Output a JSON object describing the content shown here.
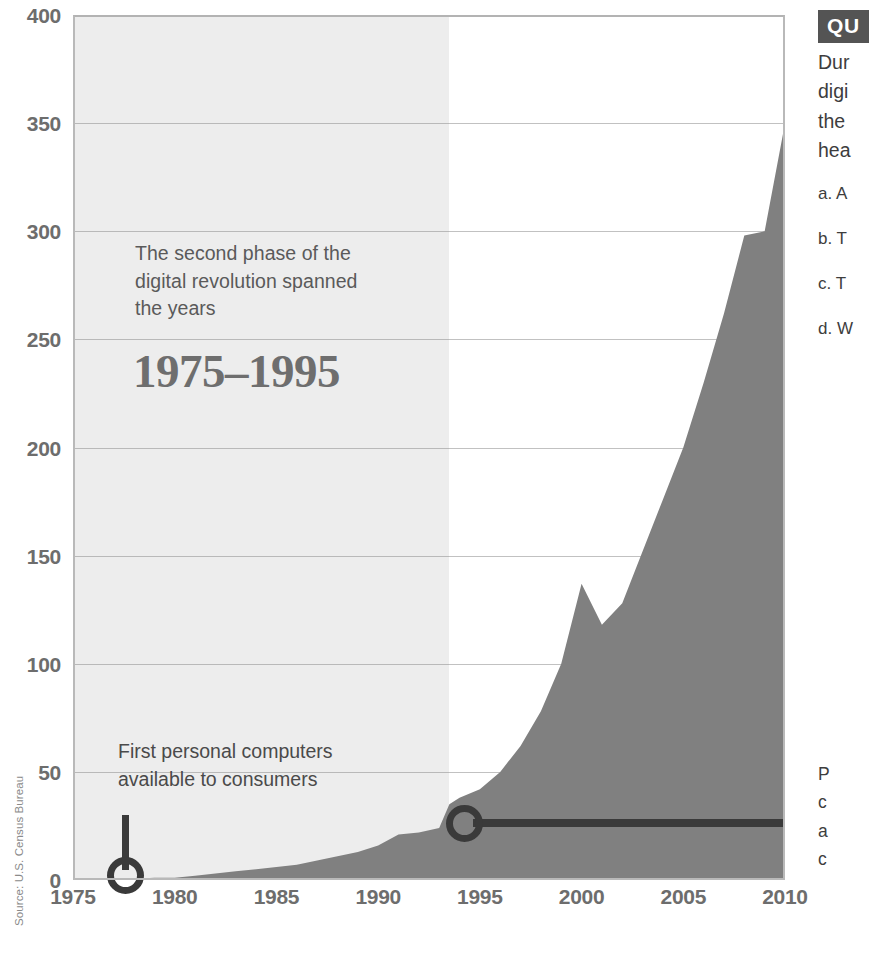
{
  "chart_data": {
    "type": "area",
    "title": "",
    "xlabel": "",
    "ylabel": "",
    "xlim": [
      1975,
      2010
    ],
    "ylim": [
      0,
      400
    ],
    "grid": true,
    "legend": null,
    "source": "Source: U.S. Census Bureau",
    "x_ticks": [
      "1975",
      "1980",
      "1985",
      "1990",
      "1995",
      "2000",
      "2005",
      "2010"
    ],
    "y_ticks": [
      "0",
      "50",
      "100",
      "150",
      "200",
      "250",
      "300",
      "350",
      "400"
    ],
    "series": [
      {
        "name": "Computers / Internet users (millions)",
        "x": [
          1975,
          1977,
          1979,
          1980,
          1981,
          1982,
          1983,
          1984,
          1985,
          1986,
          1987,
          1988,
          1989,
          1990,
          1991,
          1992,
          1993,
          1993.5,
          1994,
          1995,
          1996,
          1997,
          1998,
          1999,
          2000,
          2001,
          2002,
          2003,
          2004,
          2005,
          2006,
          2007,
          2008,
          2009,
          2010
        ],
        "values": [
          0,
          0,
          1,
          1,
          2,
          3,
          4,
          5,
          6,
          7,
          9,
          11,
          13,
          16,
          21,
          22,
          24,
          35,
          38,
          42,
          50,
          62,
          78,
          100,
          137,
          118,
          128,
          152,
          176,
          200,
          230,
          262,
          298,
          300,
          350
        ]
      }
    ],
    "highlight_band": {
      "label": "1975–1995",
      "x_start": 1975,
      "x_end": 1993.5,
      "note": "The second phase of the digital revolution spanned the years"
    },
    "annotations": [
      {
        "name": "first-personal-computers",
        "text_line_1": "First personal computers",
        "text_line_2": "available to consumers",
        "x": 1977,
        "y": 0
      },
      {
        "name": "band-end-marker",
        "x": 1993.5,
        "y": 35
      }
    ],
    "colors": {
      "area_fill": "#808080",
      "highlight_band": "#ededed",
      "gridline": "#8e8e8e",
      "axis_text": "#6d6d6d",
      "annotation_text": "#4a4a4a",
      "marker": "#3a3a3a",
      "badge_bg": "#545454"
    }
  },
  "axis": {
    "y_labels": [
      "400",
      "350",
      "300",
      "250",
      "200",
      "150",
      "100",
      "50",
      "0"
    ],
    "x_labels": [
      "1975",
      "1980",
      "1985",
      "1990",
      "1995",
      "2000",
      "2005",
      "2010"
    ]
  },
  "source": {
    "text": "Source: U.S. Census Bureau"
  },
  "band_note": {
    "line1": "The second phase of the",
    "line2": "digital revolution spanned",
    "line3": "the years",
    "years": "1975–1995"
  },
  "pc_note": {
    "line1": "First personal computers",
    "line2": "available to consumers"
  },
  "question": {
    "badge": "QU",
    "stem": {
      "line1": "Dur",
      "line2": "digi",
      "line3": "the",
      "line4": "hea"
    },
    "choices": [
      "a. A",
      "b. T",
      "c. T",
      "d. W"
    ]
  },
  "side_note": {
    "line1": "P",
    "line2": "c",
    "line3": "a",
    "line4": "c"
  }
}
